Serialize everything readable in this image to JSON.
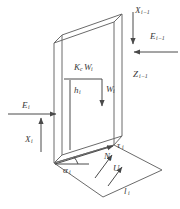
{
  "figure": {
    "type": "engineering-diagram",
    "background_color": "#ffffff",
    "line_color": "#595959",
    "text_color": "#3a3a3a"
  },
  "labels": {
    "x_prev": {
      "base": "X",
      "sub": "i−1",
      "text": "X i−1"
    },
    "e_prev": {
      "base": "E",
      "sub": "i−1",
      "text": "E i−1"
    },
    "z_prev": {
      "base": "Z",
      "sub": "i−1",
      "text": "Z i−1"
    },
    "kc_w": {
      "base": "K",
      "sub": "c",
      "base2": "W",
      "sub2": "i",
      "text": "K c W i"
    },
    "w": {
      "base": "W",
      "sub": "i",
      "text": "W i"
    },
    "h": {
      "base": "h",
      "sub": "i",
      "text": "h i"
    },
    "e": {
      "base": "E",
      "sub": "i",
      "text": "E i"
    },
    "x": {
      "base": "X",
      "sub": "i",
      "text": "X i"
    },
    "alpha": {
      "base": "α",
      "sub": "i",
      "text": "α i"
    },
    "tau": {
      "base": "τ",
      "sub": "i",
      "text": "τ i"
    },
    "n": {
      "base": "N",
      "sub": "i",
      "text": "N i"
    },
    "u": {
      "base": "U",
      "sub": "i",
      "text": "U i"
    },
    "l": {
      "base": "l",
      "sub": "i",
      "text": "l i"
    }
  }
}
